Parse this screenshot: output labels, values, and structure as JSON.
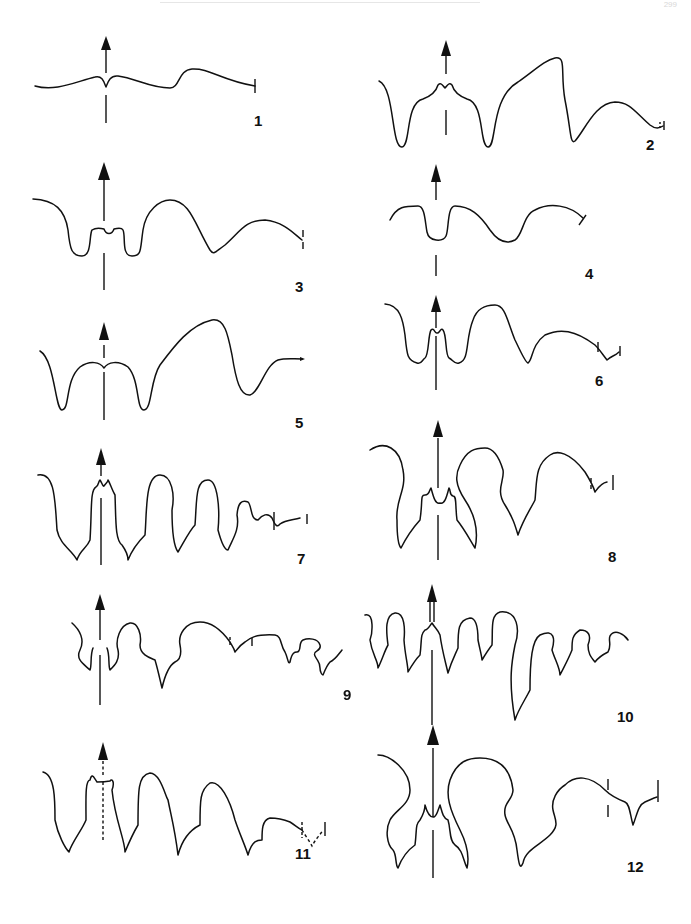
{
  "header": {
    "running_head": "",
    "page_number": "299"
  },
  "figure": {
    "panels": [
      {
        "id": 1,
        "label": "1"
      },
      {
        "id": 2,
        "label": "2"
      },
      {
        "id": 3,
        "label": "3"
      },
      {
        "id": 4,
        "label": "4"
      },
      {
        "id": 5,
        "label": "5"
      },
      {
        "id": 6,
        "label": "6"
      },
      {
        "id": 7,
        "label": "7"
      },
      {
        "id": 8,
        "label": "8"
      },
      {
        "id": 9,
        "label": "9"
      },
      {
        "id": 10,
        "label": "10"
      },
      {
        "id": 11,
        "label": "11"
      },
      {
        "id": 12,
        "label": "12"
      }
    ]
  }
}
